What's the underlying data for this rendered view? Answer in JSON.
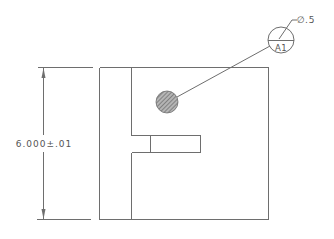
{
  "drawing": {
    "type": "engineering-drawing",
    "colors": {
      "line": "#6e6e6e",
      "text": "#555555",
      "hatch": "#8a8a8a",
      "background": "#ffffff"
    },
    "dimension": {
      "label": "6.000±.01",
      "orientation": "vertical"
    },
    "balloon": {
      "label": "A1"
    },
    "callout": {
      "symbol": "∅",
      "value": ".5"
    },
    "features": [
      {
        "name": "outer-profile"
      },
      {
        "name": "vertical-web"
      },
      {
        "name": "slot"
      },
      {
        "name": "hatched-hole"
      }
    ]
  }
}
